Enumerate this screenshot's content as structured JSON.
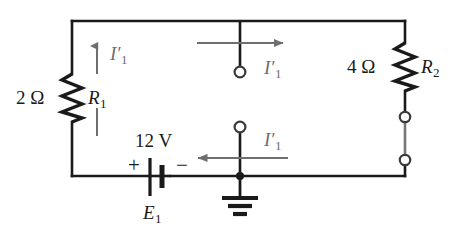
{
  "figure": {
    "kind": "circuit-schematic",
    "background_color": "#ffffff",
    "wire_color": "#1a1a1a",
    "current_color": "#6e6e6e"
  },
  "components": {
    "resistor_left": {
      "value_label": "2 Ω",
      "name_main": "R",
      "name_sub": "1"
    },
    "resistor_right": {
      "value_label": "4 Ω",
      "name_main": "R",
      "name_sub": "2"
    },
    "source": {
      "value_label": "12 V",
      "name_main": "E",
      "name_sub": "1",
      "plus_sign": "+",
      "minus_sign": "−"
    },
    "ground": {
      "name": "earth-ground"
    }
  },
  "currents": {
    "left_branch": {
      "main": "I",
      "prime": "′",
      "sub": "1",
      "direction": "up"
    },
    "top_branch": {
      "main": "I",
      "prime": "′",
      "sub": "1",
      "direction": "right"
    },
    "bottom_branch": {
      "main": "I",
      "prime": "′",
      "sub": "1",
      "direction": "left"
    }
  },
  "terminals": {
    "top_probe": "open-terminal",
    "bottom_probe": "open-terminal",
    "right_upper": "open-terminal",
    "right_lower": "open-terminal"
  }
}
